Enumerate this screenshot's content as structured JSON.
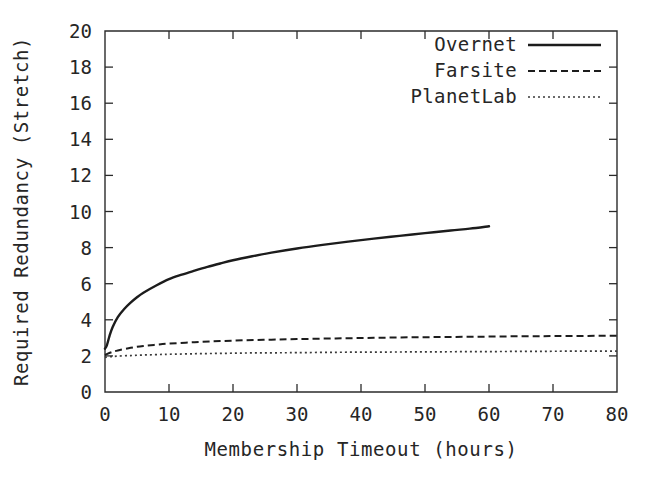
{
  "chart_data": {
    "type": "line",
    "title": "",
    "xlabel": "Membership Timeout (hours)",
    "ylabel": "Required Redundancy (Stretch)",
    "xlim": [
      0,
      80
    ],
    "ylim": [
      0,
      20
    ],
    "xticks": [
      0,
      10,
      20,
      30,
      40,
      50,
      60,
      70,
      80
    ],
    "yticks": [
      0,
      2,
      4,
      6,
      8,
      10,
      12,
      14,
      16,
      18,
      20
    ],
    "xticklabels": [
      "0",
      "10",
      "20",
      "30",
      "40",
      "50",
      "60",
      "70",
      "80"
    ],
    "yticklabels": [
      "0",
      "2",
      "4",
      "6",
      "8",
      "10",
      "12",
      "14",
      "16",
      "18",
      "20"
    ],
    "grid": false,
    "legend_position": "top-right",
    "legend": [
      "Overnet",
      "Farsite",
      "PlanetLab"
    ],
    "series": [
      {
        "name": "Overnet",
        "style": "solid",
        "color": "#1c1c1c",
        "x": [
          0,
          0.3,
          0.7,
          1.2,
          2,
          3,
          4,
          5,
          6,
          8,
          10,
          12,
          14,
          16,
          18,
          20,
          23,
          26,
          30,
          34,
          38,
          42,
          46,
          50,
          54,
          57,
          60
        ],
        "y": [
          2.4,
          2.6,
          3.1,
          3.6,
          4.15,
          4.6,
          4.95,
          5.25,
          5.5,
          5.9,
          6.25,
          6.5,
          6.72,
          6.93,
          7.12,
          7.3,
          7.52,
          7.72,
          7.95,
          8.15,
          8.33,
          8.5,
          8.65,
          8.8,
          8.95,
          9.05,
          9.18
        ]
      },
      {
        "name": "Farsite",
        "style": "dashed",
        "color": "#1c1c1c",
        "x": [
          0,
          1,
          2,
          4,
          6,
          8,
          10,
          14,
          18,
          22,
          26,
          30,
          36,
          42,
          48,
          54,
          60,
          66,
          72,
          80
        ],
        "y": [
          2.05,
          2.2,
          2.3,
          2.45,
          2.55,
          2.62,
          2.68,
          2.76,
          2.82,
          2.87,
          2.9,
          2.93,
          2.97,
          3.0,
          3.03,
          3.05,
          3.07,
          3.09,
          3.1,
          3.12
        ]
      },
      {
        "name": "PlanetLab",
        "style": "dotted",
        "color": "#3a3a3a",
        "x": [
          0,
          1,
          2,
          4,
          6,
          8,
          10,
          14,
          18,
          22,
          26,
          30,
          36,
          42,
          48,
          54,
          60,
          66,
          72,
          80
        ],
        "y": [
          1.92,
          1.96,
          1.99,
          2.02,
          2.05,
          2.07,
          2.09,
          2.12,
          2.14,
          2.16,
          2.17,
          2.18,
          2.2,
          2.21,
          2.22,
          2.23,
          2.24,
          2.25,
          2.26,
          2.27
        ]
      }
    ]
  },
  "plot_geometry": {
    "left": 105,
    "right": 617,
    "top": 31,
    "bottom": 392
  },
  "colors": {
    "background": "#ffffff",
    "axis": "#2b2b2b",
    "text": "#262626"
  }
}
